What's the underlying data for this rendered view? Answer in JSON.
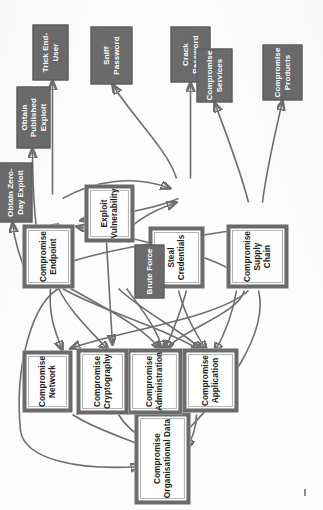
{
  "diagram": {
    "type": "attack-tree",
    "orientation": "rotated-90-ccw",
    "colors": {
      "light_node_fill": "#ffffff",
      "light_node_border": "#6b6b6b",
      "light_node_inner_rule": "#b6b6b6",
      "dark_node_fill": "#6b6b6b",
      "dark_node_text": "#ffffff",
      "edge": "#6e6e6e",
      "page_background": "#fdfdfd"
    },
    "nodes": [
      {
        "id": "org-data",
        "label": "Compromise Organisational Data",
        "style": "light"
      },
      {
        "id": "application",
        "label": "Compromise Application",
        "style": "light"
      },
      {
        "id": "administration",
        "label": "Compromise Administration",
        "style": "light"
      },
      {
        "id": "cryptography",
        "label": "Compromise Cryptography",
        "style": "light"
      },
      {
        "id": "network",
        "label": "Compromise Network",
        "style": "light"
      },
      {
        "id": "endpoint",
        "label": "Compromise Endpoint",
        "style": "light"
      },
      {
        "id": "credentials",
        "label": "Steal Credentials",
        "style": "light"
      },
      {
        "id": "supply-chain",
        "label": "Compromise Supply Chain",
        "style": "light"
      },
      {
        "id": "exploit-vuln",
        "label": "Exploit Vulnerability",
        "style": "light"
      },
      {
        "id": "brute-force",
        "label": "Brute Force",
        "style": "dark"
      },
      {
        "id": "trick-end-user",
        "label": "Trick End-User",
        "style": "dark"
      },
      {
        "id": "sniff-password",
        "label": "Sniff Password",
        "style": "dark"
      },
      {
        "id": "crack-password",
        "label": "Crack Password",
        "style": "dark"
      },
      {
        "id": "comp-services",
        "label": "Compromise Services",
        "style": "dark"
      },
      {
        "id": "comp-products",
        "label": "Compromise Products",
        "style": "dark"
      },
      {
        "id": "published-exp",
        "label": "Obtain Published Exploit",
        "style": "dark"
      },
      {
        "id": "zero-day-exp",
        "label": "Obtain Zero-Day Exploit",
        "style": "dark"
      }
    ],
    "edges": [
      {
        "from": "application",
        "to": "org-data"
      },
      {
        "from": "administration",
        "to": "org-data"
      },
      {
        "from": "cryptography",
        "to": "org-data"
      },
      {
        "from": "network",
        "to": "org-data"
      },
      {
        "from": "endpoint",
        "to": "org-data"
      },
      {
        "from": "supply-chain",
        "to": "org-data"
      },
      {
        "from": "endpoint",
        "to": "application"
      },
      {
        "from": "credentials",
        "to": "application"
      },
      {
        "from": "supply-chain",
        "to": "application"
      },
      {
        "from": "exploit-vuln",
        "to": "application"
      },
      {
        "from": "endpoint",
        "to": "administration"
      },
      {
        "from": "credentials",
        "to": "administration"
      },
      {
        "from": "supply-chain",
        "to": "administration"
      },
      {
        "from": "exploit-vuln",
        "to": "administration"
      },
      {
        "from": "cryptography",
        "to": "administration"
      },
      {
        "from": "network",
        "to": "cryptography"
      },
      {
        "from": "exploit-vuln",
        "to": "cryptography"
      },
      {
        "from": "brute-force",
        "to": "cryptography"
      },
      {
        "from": "exploit-vuln",
        "to": "network"
      },
      {
        "from": "supply-chain",
        "to": "network"
      },
      {
        "from": "credentials",
        "to": "endpoint"
      },
      {
        "from": "exploit-vuln",
        "to": "endpoint"
      },
      {
        "from": "supply-chain",
        "to": "endpoint"
      },
      {
        "from": "endpoint",
        "to": "credentials"
      },
      {
        "from": "brute-force",
        "to": "credentials"
      },
      {
        "from": "exploit-vuln",
        "to": "supply-chain"
      },
      {
        "from": "endpoint",
        "to": "trick-end-user"
      },
      {
        "from": "credentials",
        "to": "sniff-password"
      },
      {
        "from": "credentials",
        "to": "crack-password"
      },
      {
        "from": "supply-chain",
        "to": "comp-services"
      },
      {
        "from": "supply-chain",
        "to": "comp-products"
      },
      {
        "from": "exploit-vuln",
        "to": "published-exp"
      },
      {
        "from": "exploit-vuln",
        "to": "zero-day-exp"
      }
    ]
  }
}
